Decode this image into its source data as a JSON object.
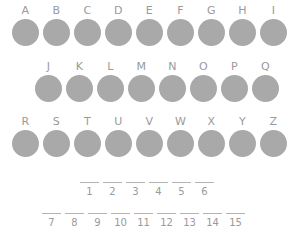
{
  "puzzle": {
    "circle_color": "#a9a9a9",
    "text_color": "#9a9a9a",
    "background_color": "#ffffff",
    "letter_rows": [
      {
        "row_id": "row-a",
        "letters": [
          "A",
          "B",
          "C",
          "D",
          "E",
          "F",
          "G",
          "H",
          "I"
        ]
      },
      {
        "row_id": "row-b",
        "letters": [
          "J",
          "K",
          "L",
          "M",
          "N",
          "O",
          "P",
          "Q"
        ]
      },
      {
        "row_id": "row-c",
        "letters": [
          "R",
          "S",
          "T",
          "U",
          "V",
          "W",
          "X",
          "Y",
          "Z"
        ]
      }
    ],
    "answer_rows": [
      {
        "row_id": "blanks-upper",
        "numbers": [
          "1",
          "2",
          "3",
          "4",
          "5",
          "6"
        ]
      },
      {
        "row_id": "blanks-lower",
        "numbers": [
          "7",
          "8",
          "9",
          "10",
          "11",
          "12",
          "13",
          "14",
          "15"
        ]
      }
    ]
  }
}
